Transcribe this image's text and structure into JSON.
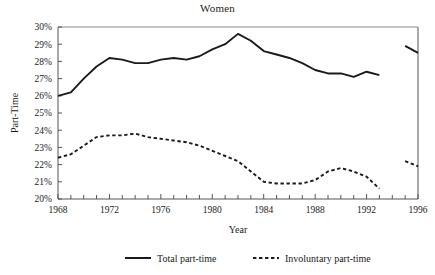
{
  "chart_data": {
    "type": "line",
    "title": "Women",
    "xlabel": "Year",
    "ylabel": "Part-Time",
    "xlim": [
      1968,
      1996
    ],
    "ylim": [
      20,
      30
    ],
    "grid": false,
    "legend_position": "bottom",
    "ytick_labels": [
      "20%",
      "21%",
      "22%",
      "23%",
      "24%",
      "25%",
      "26%",
      "27%",
      "28%",
      "29%",
      "30%"
    ],
    "ytick_values": [
      20,
      21,
      22,
      23,
      24,
      25,
      26,
      27,
      28,
      29,
      30
    ],
    "xtick_labels": [
      "1968",
      "1972",
      "1976",
      "1980",
      "1984",
      "1988",
      "1992",
      "1996"
    ],
    "xtick_values": [
      1968,
      1972,
      1976,
      1980,
      1984,
      1988,
      1992,
      1996
    ],
    "xtick_minor_values": [
      1969,
      1970,
      1971,
      1973,
      1974,
      1975,
      1977,
      1978,
      1979,
      1981,
      1982,
      1983,
      1985,
      1986,
      1987,
      1989,
      1990,
      1991,
      1993,
      1994,
      1995
    ],
    "x": [
      1968,
      1969,
      1970,
      1971,
      1972,
      1973,
      1974,
      1975,
      1976,
      1977,
      1978,
      1979,
      1980,
      1981,
      1982,
      1983,
      1984,
      1985,
      1986,
      1987,
      1988,
      1989,
      1990,
      1991,
      1992,
      1993,
      1995,
      1996
    ],
    "series": [
      {
        "name": "Total part-time",
        "style": "solid",
        "color": "#1a1a1a",
        "break_after": 1993,
        "values": [
          26.0,
          26.2,
          27.0,
          27.7,
          28.2,
          28.1,
          27.9,
          27.9,
          28.1,
          28.2,
          28.1,
          28.3,
          28.7,
          29.0,
          29.6,
          29.2,
          28.6,
          28.4,
          28.2,
          27.9,
          27.5,
          27.3,
          27.3,
          27.1,
          27.4,
          27.2,
          28.9,
          28.5
        ]
      },
      {
        "name": "Involuntary part-time",
        "style": "dashed",
        "color": "#1a1a1a",
        "break_after": 1993,
        "values": [
          22.4,
          22.6,
          23.1,
          23.6,
          23.7,
          23.7,
          23.8,
          23.6,
          23.5,
          23.4,
          23.3,
          23.1,
          22.8,
          22.5,
          22.2,
          21.6,
          21.0,
          20.9,
          20.9,
          20.9,
          21.1,
          21.6,
          21.8,
          21.6,
          21.3,
          20.6,
          22.2,
          21.9
        ]
      }
    ]
  },
  "legend": {
    "items": [
      {
        "label": "Total part-time",
        "style": "solid"
      },
      {
        "label": "Involuntary part-time",
        "style": "dashed"
      }
    ]
  }
}
